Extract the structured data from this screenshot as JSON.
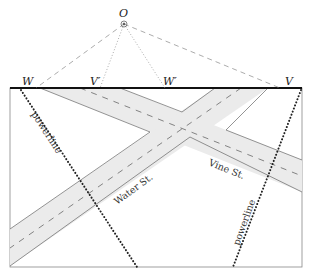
{
  "diagram": {
    "points": {
      "observer": "O",
      "w": "W",
      "v_prime": "V′",
      "w_prime": "W′",
      "v": "V"
    },
    "roads": {
      "water": "Water St.",
      "vine": "Vine St."
    },
    "powerlines": {
      "left": "powerline",
      "right": "powerline"
    },
    "colors": {
      "road_fill": "#ebebeb",
      "road_edge": "#666666",
      "frame": "#888888",
      "picture_line": "#111111",
      "sight_lines": "#888888"
    }
  }
}
